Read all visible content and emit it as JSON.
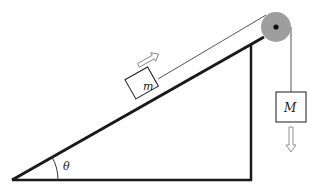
{
  "diagram": {
    "title": "",
    "type": "inclined-plane-pulley",
    "labels": {
      "small_mass": "m",
      "hanging_mass": "M",
      "angle": "θ"
    },
    "colors": {
      "lines": "#1a1a1a",
      "rope": "#555555",
      "pulley_fill": "#9e9e9e",
      "pulley_axle": "#111111",
      "block_fill": "#ffffff",
      "arrow_stroke": "#777777"
    },
    "geometry": {
      "incline_base_left": [
        12,
        180
      ],
      "incline_base_right": [
        251,
        180
      ],
      "incline_top": [
        251,
        44
      ],
      "pulley_center": [
        276,
        27
      ],
      "pulley_radius": 15,
      "hanging_block": {
        "x": 276,
        "y": 92,
        "w": 30,
        "h": 30
      }
    },
    "arrows": {
      "small_mass_direction": "up-incline",
      "hanging_mass_direction": "down"
    }
  }
}
